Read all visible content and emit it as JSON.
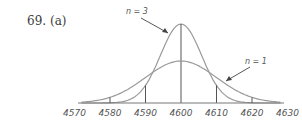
{
  "problem": {
    "number": "69.",
    "part": "(a)"
  },
  "chart_data": {
    "type": "line",
    "title": "",
    "xlabel": "",
    "ylabel": "",
    "xlim": [
      4570,
      4630
    ],
    "x_ticks": [
      4570,
      4580,
      4590,
      4600,
      4610,
      4620,
      4630
    ],
    "tick_labels": [
      "4570",
      "4580",
      "4590",
      "4600",
      "4610",
      "4620",
      "4630"
    ],
    "grid": false,
    "series": [
      {
        "name": "n = 3",
        "mean": 4600,
        "sd": 5.77,
        "shape": "normal curve, taller and narrower",
        "marked_x": [
          4590,
          4600,
          4610
        ]
      },
      {
        "name": "n = 1",
        "mean": 4600,
        "sd": 10,
        "shape": "normal curve, shorter and wider",
        "marked_x": [
          4580,
          4620
        ]
      }
    ],
    "annotations": [
      {
        "text": "n = 3",
        "points_to": "taller curve, left flank near x≈4597"
      },
      {
        "text": "n = 1",
        "points_to": "wider curve, right flank near x≈4612"
      }
    ],
    "colors": {
      "curve": "#9a9a9a",
      "line": "#555555",
      "axis": "#777777"
    }
  },
  "annotations": {
    "n3": "n = 3",
    "n1": "n = 1"
  }
}
